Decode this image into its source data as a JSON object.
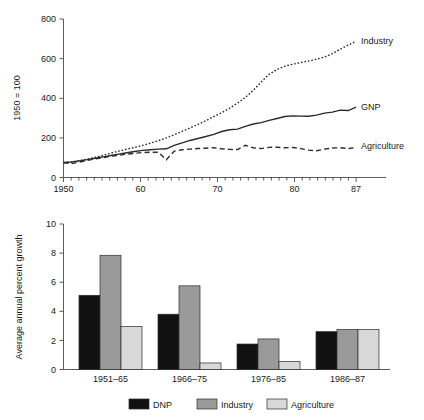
{
  "chart_data": [
    {
      "type": "line",
      "title": "",
      "xlabel": "",
      "ylabel": "1950 = 100",
      "xlim": [
        1950,
        87.8
      ],
      "ylim": [
        0,
        800
      ],
      "grid": false,
      "legend_position": "right-inline",
      "x_tick_labels": [
        "1950",
        "60",
        "70",
        "80",
        "87"
      ],
      "x_tick_values": [
        1950,
        1960,
        1970,
        1980,
        1987
      ],
      "y_tick_labels": [
        "0",
        "200",
        "400",
        "600",
        "800"
      ],
      "y_tick_values": [
        0,
        200,
        400,
        600,
        800
      ],
      "minor_x_ticks_every": 1,
      "series": [
        {
          "name": "Industry",
          "style": "dotted",
          "label": "Industry",
          "x": [
            1950,
            1951,
            1952,
            1953,
            1954,
            1955,
            1956,
            1957,
            1958,
            1959,
            1960,
            1961,
            1962,
            1963,
            1964,
            1965,
            1966,
            1967,
            1968,
            1969,
            1970,
            1971,
            1972,
            1973,
            1974,
            1975,
            1976,
            1977,
            1978,
            1979,
            1980,
            1981,
            1982,
            1983,
            1984,
            1985,
            1986,
            1987
          ],
          "values": [
            75,
            78,
            85,
            93,
            102,
            112,
            123,
            133,
            143,
            152,
            162,
            173,
            186,
            200,
            216,
            233,
            250,
            268,
            287,
            307,
            327,
            350,
            375,
            404,
            440,
            482,
            521,
            545,
            562,
            572,
            580,
            588,
            597,
            608,
            625,
            648,
            668,
            688
          ]
        },
        {
          "name": "GNP",
          "style": "solid",
          "label": "GNP",
          "x": [
            1950,
            1951,
            1952,
            1953,
            1954,
            1955,
            1956,
            1957,
            1958,
            1959,
            1960,
            1961,
            1962,
            1963,
            1964,
            1965,
            1966,
            1967,
            1968,
            1969,
            1970,
            1971,
            1972,
            1973,
            1974,
            1975,
            1976,
            1977,
            1978,
            1979,
            1980,
            1981,
            1982,
            1983,
            1984,
            1985,
            1986,
            1987
          ],
          "values": [
            76,
            78,
            84,
            90,
            97,
            104,
            111,
            118,
            125,
            131,
            137,
            140,
            143,
            145,
            162,
            175,
            187,
            197,
            207,
            218,
            232,
            241,
            244,
            258,
            270,
            277,
            288,
            298,
            308,
            311,
            310,
            309,
            315,
            325,
            330,
            340,
            338,
            355
          ]
        },
        {
          "name": "Agriculture",
          "style": "dashed",
          "label": "Agriculture",
          "x": [
            1950,
            1951,
            1952,
            1953,
            1954,
            1955,
            1956,
            1957,
            1958,
            1959,
            1960,
            1961,
            1962,
            1963,
            1964,
            1965,
            1966,
            1967,
            1968,
            1969,
            1970,
            1971,
            1972,
            1973,
            1974,
            1975,
            1976,
            1977,
            1978,
            1979,
            1980,
            1981,
            1982,
            1983,
            1984,
            1985,
            1986,
            1987
          ],
          "values": [
            74,
            70,
            78,
            86,
            94,
            100,
            107,
            112,
            118,
            122,
            126,
            128,
            127,
            90,
            133,
            140,
            143,
            146,
            148,
            150,
            145,
            142,
            141,
            163,
            150,
            146,
            152,
            153,
            150,
            152,
            146,
            138,
            135,
            143,
            149,
            150,
            146,
            151
          ]
        }
      ]
    },
    {
      "type": "bar",
      "title": "",
      "xlabel": "",
      "ylabel": "Average annual percent growth",
      "ylim": [
        0,
        10
      ],
      "grid": false,
      "legend_position": "bottom",
      "categories": [
        "1951–65",
        "1966–75",
        "1976–85",
        "1986–87"
      ],
      "y_tick_labels": [
        "0",
        "2",
        "4",
        "6",
        "8",
        "10"
      ],
      "y_tick_values": [
        0,
        2,
        4,
        6,
        8,
        10
      ],
      "series": [
        {
          "name": "DNP",
          "label": "DNP",
          "color": "#111111",
          "values": [
            5.1,
            3.8,
            1.75,
            2.6
          ]
        },
        {
          "name": "Industry",
          "label": "Industry",
          "color": "#9a9a9a",
          "values": [
            7.85,
            5.75,
            2.1,
            2.75
          ]
        },
        {
          "name": "Agriculture",
          "label": "Agriculture",
          "color": "#d8d8d8",
          "values": [
            2.95,
            0.45,
            0.55,
            2.75
          ]
        }
      ]
    }
  ]
}
